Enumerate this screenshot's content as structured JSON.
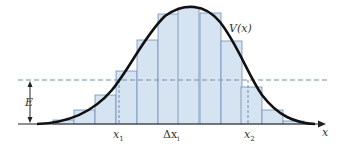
{
  "diagram": {
    "curve_label": "V(x)",
    "energy_label": "E",
    "x1_label": "x",
    "x1_sub": "1",
    "x2_label": "x",
    "x2_sub": "2",
    "dx_label": "Δx",
    "dx_sub": "i",
    "axis_label": "x",
    "colors": {
      "bar_fill": "#d6e3f0",
      "bar_stroke": "#6f8fb5",
      "curve": "#111111",
      "dashed": "#6f8fb5",
      "axis": "#222222"
    },
    "baseline_y": 124,
    "energy_y": 80,
    "bars": [
      {
        "x": 53,
        "top": 120
      },
      {
        "x": 74,
        "top": 110
      },
      {
        "x": 95,
        "top": 95
      },
      {
        "x": 116,
        "top": 71
      },
      {
        "x": 137,
        "top": 40
      },
      {
        "x": 158,
        "top": 14
      },
      {
        "x": 178,
        "top": 8
      },
      {
        "x": 200,
        "top": 13
      },
      {
        "x": 221,
        "top": 41
      },
      {
        "x": 241,
        "top": 87
      },
      {
        "x": 262,
        "top": 110
      },
      {
        "x": 283,
        "top": 121
      }
    ],
    "bar_width": 21
  }
}
